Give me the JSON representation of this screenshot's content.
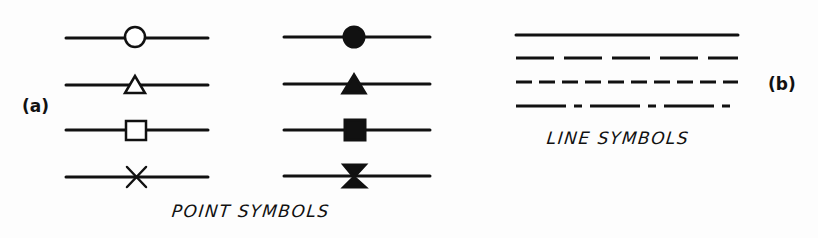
{
  "colors": {
    "ink": "#111111",
    "background": "#fdfdfd"
  },
  "panel_a": {
    "label": "(a)",
    "caption": "POINT SYMBOLS",
    "open_symbols": [
      "open-circle",
      "open-triangle",
      "open-square",
      "cross"
    ],
    "filled_symbols": [
      "filled-circle",
      "filled-triangle",
      "filled-square",
      "filled-hourglass"
    ]
  },
  "panel_b": {
    "label": "(b)",
    "caption": "LINE SYMBOLS",
    "line_styles": [
      "solid",
      "long-dash",
      "short-dash",
      "dash-dot"
    ]
  }
}
